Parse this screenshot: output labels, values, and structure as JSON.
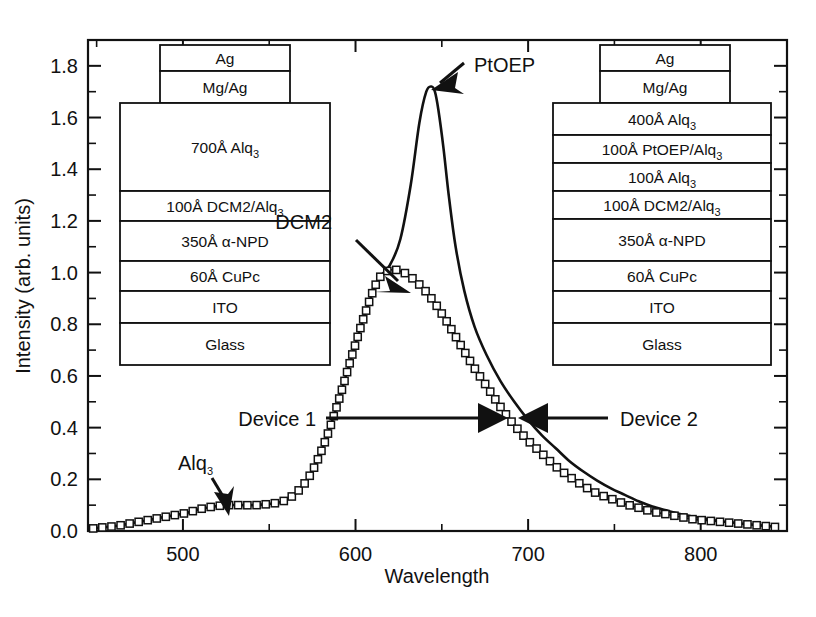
{
  "chart_data": {
    "type": "line",
    "title": "",
    "xlabel": "Wavelength",
    "ylabel": "Intensity (arb. units)",
    "xlim": [
      445,
      850
    ],
    "ylim": [
      0.0,
      1.9
    ],
    "xticks": [
      500,
      600,
      700,
      800
    ],
    "xtick_labels": [
      "500",
      "600",
      "700",
      "800"
    ],
    "yticks": [
      0.0,
      0.2,
      0.4,
      0.6,
      0.8,
      1.0,
      1.2,
      1.4,
      1.6,
      1.8
    ],
    "ytick_labels": [
      "0.0",
      "0.2",
      "0.4",
      "0.6",
      "0.8",
      "1.0",
      "1.2",
      "1.4",
      "1.6",
      "1.8"
    ],
    "minor_ticks": true,
    "grid": false,
    "legend_position": "none",
    "series": [
      {
        "name": "Device 1",
        "marker": "open-square",
        "style": "markers",
        "x": [
          448,
          455,
          462,
          470,
          478,
          486,
          494,
          502,
          510,
          518,
          526,
          534,
          542,
          550,
          558,
          566,
          574,
          582,
          590,
          598,
          606,
          613,
          620,
          628,
          636,
          644,
          652,
          660,
          668,
          676,
          684,
          692,
          700,
          708,
          716,
          724,
          732,
          740,
          748,
          756,
          764,
          772,
          780,
          788,
          796,
          804,
          812,
          820,
          828,
          836,
          844
        ],
        "y": [
          0.01,
          0.015,
          0.02,
          0.03,
          0.04,
          0.05,
          0.06,
          0.07,
          0.085,
          0.095,
          0.1,
          0.1,
          0.1,
          0.105,
          0.115,
          0.15,
          0.22,
          0.34,
          0.5,
          0.68,
          0.85,
          0.97,
          1.01,
          1.0,
          0.96,
          0.9,
          0.82,
          0.73,
          0.64,
          0.56,
          0.48,
          0.41,
          0.35,
          0.3,
          0.25,
          0.21,
          0.175,
          0.145,
          0.125,
          0.105,
          0.09,
          0.075,
          0.065,
          0.055,
          0.045,
          0.04,
          0.035,
          0.03,
          0.025,
          0.02,
          0.015
        ]
      },
      {
        "name": "Device 2",
        "marker": "none",
        "style": "solid-line",
        "x": [
          448,
          455,
          462,
          470,
          478,
          486,
          494,
          502,
          510,
          518,
          526,
          534,
          542,
          550,
          558,
          566,
          574,
          582,
          590,
          598,
          606,
          613,
          620,
          626,
          632,
          637,
          641,
          644,
          646,
          648,
          651,
          654,
          658,
          663,
          669,
          676,
          684,
          692,
          700,
          708,
          716,
          724,
          732,
          740,
          748,
          756,
          764,
          772,
          780,
          788,
          796,
          804,
          812,
          820,
          828,
          836,
          844
        ],
        "y": [
          0.01,
          0.015,
          0.02,
          0.03,
          0.04,
          0.05,
          0.06,
          0.07,
          0.085,
          0.095,
          0.1,
          0.1,
          0.1,
          0.105,
          0.115,
          0.15,
          0.22,
          0.34,
          0.5,
          0.68,
          0.85,
          0.97,
          1.03,
          1.13,
          1.34,
          1.58,
          1.7,
          1.72,
          1.7,
          1.63,
          1.48,
          1.3,
          1.1,
          0.93,
          0.79,
          0.68,
          0.58,
          0.5,
          0.43,
          0.37,
          0.32,
          0.27,
          0.23,
          0.195,
          0.165,
          0.14,
          0.115,
          0.095,
          0.08,
          0.066,
          0.055,
          0.046,
          0.038,
          0.032,
          0.026,
          0.021,
          0.016
        ]
      }
    ],
    "annotations": [
      {
        "name": "alq3-peak-label",
        "text": "Alq3",
        "text_display": "Alq",
        "subscript": "3",
        "points_to_x": 522,
        "points_to_y": 0.105
      },
      {
        "name": "dcm2-peak-label",
        "text": "DCM2",
        "points_to_x": 640,
        "points_to_y": 0.93
      },
      {
        "name": "ptoep-peak-label",
        "text": "PtOEP",
        "points_to_x": 644,
        "points_to_y": 1.73
      },
      {
        "name": "device1-label",
        "text": "Device 1",
        "points_to_x": 682,
        "points_to_y": 0.44
      },
      {
        "name": "device2-label",
        "text": "Device 2",
        "points_to_x": 698,
        "points_to_y": 0.44
      }
    ]
  },
  "device_diagrams": [
    {
      "name": "device-1-stack",
      "layers": [
        {
          "label": "Ag",
          "sub": ""
        },
        {
          "label": "Mg/Ag",
          "sub": ""
        },
        {
          "label": "700Å Alq",
          "sub": "3"
        },
        {
          "label": "100Å DCM2/Alq",
          "sub": "3"
        },
        {
          "label": "350Å α-NPD",
          "sub": ""
        },
        {
          "label": "60Å CuPc",
          "sub": ""
        },
        {
          "label": "ITO",
          "sub": ""
        },
        {
          "label": "Glass",
          "sub": ""
        }
      ]
    },
    {
      "name": "device-2-stack",
      "layers": [
        {
          "label": "Ag",
          "sub": ""
        },
        {
          "label": "Mg/Ag",
          "sub": ""
        },
        {
          "label": "400Å Alq",
          "sub": "3"
        },
        {
          "label": "100Å PtOEP/Alq",
          "sub": "3"
        },
        {
          "label": "100Å Alq",
          "sub": "3"
        },
        {
          "label": "100Å DCM2/Alq",
          "sub": "3"
        },
        {
          "label": "350Å α-NPD",
          "sub": ""
        },
        {
          "label": "60Å CuPc",
          "sub": ""
        },
        {
          "label": "ITO",
          "sub": ""
        },
        {
          "label": "Glass",
          "sub": ""
        }
      ]
    }
  ],
  "colors": {
    "ink": "#111111",
    "paper": "#ffffff"
  }
}
